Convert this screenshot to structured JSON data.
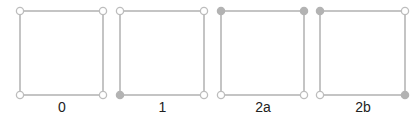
{
  "colors": {
    "line": "#c4c4c4",
    "filled_vertex": "#b3b3b3",
    "open_vertex_fill": "#ffffff",
    "open_vertex_stroke": "#bdbdbd",
    "label": "#222222"
  },
  "squares": [
    {
      "label": "0",
      "x1": 20,
      "y1": 11,
      "x2": 103,
      "y2": 95,
      "filled": {
        "tl": false,
        "tr": false,
        "bl": false,
        "br": false
      }
    },
    {
      "label": "1",
      "x1": 120,
      "y1": 11,
      "x2": 204,
      "y2": 95,
      "filled": {
        "tl": false,
        "tr": false,
        "bl": true,
        "br": false
      }
    },
    {
      "label": "2a",
      "x1": 221,
      "y1": 11,
      "x2": 304,
      "y2": 95,
      "filled": {
        "tl": true,
        "tr": true,
        "bl": false,
        "br": false
      }
    },
    {
      "label": "2b",
      "x1": 320,
      "y1": 11,
      "x2": 405,
      "y2": 95,
      "filled": {
        "tl": true,
        "tr": false,
        "bl": false,
        "br": true
      }
    }
  ]
}
